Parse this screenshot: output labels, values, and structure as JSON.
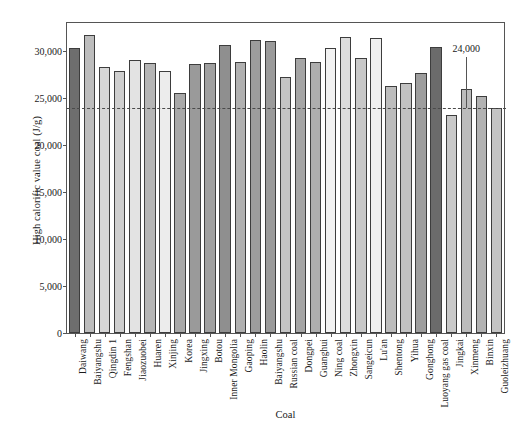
{
  "chart_data": {
    "type": "bar",
    "title": "",
    "xlabel": "Coal",
    "ylabel": "High calorific value coal (J/g)",
    "ylim": [
      0,
      33000
    ],
    "ytick_values": [
      0,
      5000,
      10000,
      15000,
      20000,
      25000,
      30000
    ],
    "ytick_labels": [
      "0",
      "5,000",
      "10,000",
      "15,000",
      "20,000",
      "25,000",
      "30,000"
    ],
    "grid": false,
    "legend": "none",
    "categories": [
      "Daiwang",
      "Baiyangshu",
      "Qingdin 1",
      "Fengshan",
      "Jiaozuobei",
      "Huaren",
      "Xinjing",
      "Korea",
      "Jingxing",
      "Botou",
      "Inner Mongolia",
      "Gaoping",
      "Haolin",
      "Baiyangshu",
      "Russian coal",
      "Dongpei",
      "Guanghui",
      "Ning coal",
      "Zhongxin",
      "Sangeicun",
      "Lu'an",
      "Shentong",
      "Yihua",
      "Gonghong",
      "Luoyang gas coal",
      "Jingkai",
      "Xinmeng",
      "Binxin",
      "Guoleizhuang"
    ],
    "values": [
      30300,
      31700,
      28300,
      27900,
      29100,
      28700,
      27900,
      25500,
      28600,
      28700,
      30700,
      28800,
      31200,
      31100,
      27300,
      29300,
      28900,
      30300,
      31500,
      29300,
      31400,
      26300,
      26600,
      27700,
      30400,
      23200,
      26000,
      25200,
      24000
    ],
    "bar_colors": [
      "#6e6e6e",
      "#bdbdbd",
      "#d6d6d6",
      "#cfcfcf",
      "#e3e3e3",
      "#b5b5b5",
      "#ececec",
      "#a8a8a8",
      "#9a9a9a",
      "#a0a0a0",
      "#8f8f8f",
      "#b0b0b0",
      "#9d9d9d",
      "#9a9a9a",
      "#c4c4c4",
      "#a5a5a5",
      "#aeaeae",
      "#f2f2f2",
      "#dcdcdc",
      "#c8c8c8",
      "#efefef",
      "#bdbdbd",
      "#c2c2c2",
      "#9e9e9e",
      "#6b6b6b",
      "#c9c9c9",
      "#bcbcbc",
      "#b2b2b2",
      "#c4c4c4"
    ],
    "threshold": {
      "value": 24000,
      "label": "24,000",
      "style": "dashed"
    }
  }
}
